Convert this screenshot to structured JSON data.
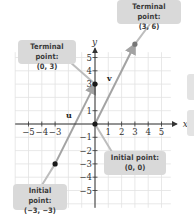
{
  "diagram": {
    "axes": {
      "x_label": "x",
      "y_label": "y",
      "x_ticks": [
        "-5",
        "-4",
        "-3",
        "1",
        "2",
        "3",
        "4",
        "5"
      ],
      "y_ticks": [
        "5",
        "4",
        "3",
        "1",
        "-1",
        "-2",
        "-3",
        "-4",
        "-5"
      ],
      "range": {
        "x": [
          -6,
          6
        ],
        "y": [
          -6,
          6
        ]
      },
      "grid": true
    },
    "vectors": [
      {
        "name": "u",
        "label": "u",
        "initial": [
          -3,
          -3
        ],
        "terminal": [
          0,
          3
        ],
        "color": "#9a9a9a"
      },
      {
        "name": "v",
        "label": "v",
        "initial": [
          0,
          0
        ],
        "terminal": [
          3,
          6
        ],
        "color": "#9a9a9a"
      }
    ],
    "callouts": [
      {
        "id": "terminal-u",
        "line1": "Terminal point:",
        "line2": "(0, 3)",
        "point": [
          0,
          3
        ]
      },
      {
        "id": "terminal-v",
        "line1": "Terminal point:",
        "line2": "(3, 6)",
        "point": [
          3,
          6
        ]
      },
      {
        "id": "initial-v",
        "line1": "Initial point:",
        "line2": "(0, 0)",
        "point": [
          0,
          0
        ]
      },
      {
        "id": "initial-u",
        "line1": "Initial point:",
        "line2": "(−3, −3)",
        "point": [
          -3,
          -3
        ]
      }
    ],
    "colors": {
      "grid": "#e2e2e2",
      "axis": "#333333",
      "vector": "#a3a3a3",
      "point": "#1a1a1a",
      "callout_bg": "#d9d9d9",
      "leader": "#bdbdbd"
    }
  }
}
